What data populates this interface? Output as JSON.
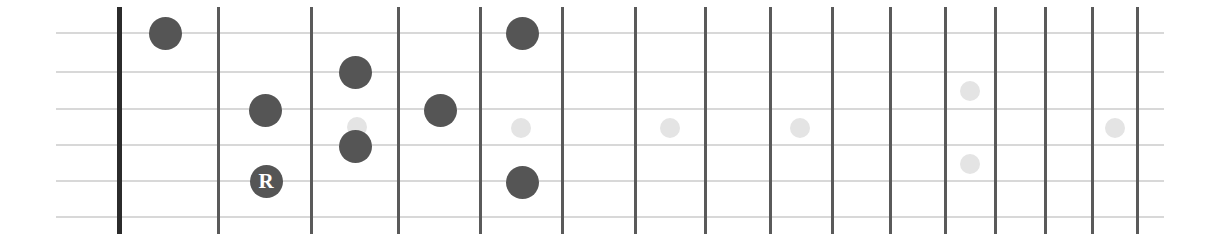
{
  "diagram": {
    "type": "guitar-fretboard",
    "background_color": "#ffffff",
    "note_color": "#555555",
    "inlay_color": "#e4e4e4",
    "string_color": "#d8d8d8",
    "fret_color": "#5a5a5a",
    "nut_color": "#2b2b2b",
    "string_count": 6,
    "fret_count": 15,
    "board": {
      "left": 56,
      "right": 1164,
      "top": 33,
      "bottom": 217
    },
    "strings": [
      {
        "index": 1,
        "y": 33
      },
      {
        "index": 2,
        "y": 72
      },
      {
        "index": 3,
        "y": 109
      },
      {
        "index": 4,
        "y": 145
      },
      {
        "index": 5,
        "y": 181
      },
      {
        "index": 6,
        "y": 217
      }
    ],
    "frets": [
      {
        "index": 0,
        "x": 119,
        "is_nut": true
      },
      {
        "index": 1,
        "x": 218,
        "is_nut": false
      },
      {
        "index": 2,
        "x": 311,
        "is_nut": false
      },
      {
        "index": 3,
        "x": 398,
        "is_nut": false
      },
      {
        "index": 4,
        "x": 480,
        "is_nut": false
      },
      {
        "index": 5,
        "x": 562,
        "is_nut": false
      },
      {
        "index": 6,
        "x": 635,
        "is_nut": false
      },
      {
        "index": 7,
        "x": 705,
        "is_nut": false
      },
      {
        "index": 8,
        "x": 770,
        "is_nut": false
      },
      {
        "index": 9,
        "x": 832,
        "is_nut": false
      },
      {
        "index": 10,
        "x": 890,
        "is_nut": false
      },
      {
        "index": 11,
        "x": 945,
        "is_nut": false
      },
      {
        "index": 12,
        "x": 995,
        "is_nut": false
      },
      {
        "index": 13,
        "x": 1045,
        "is_nut": false
      },
      {
        "index": 14,
        "x": 1092,
        "is_nut": false
      },
      {
        "index": 15,
        "x": 1137,
        "is_nut": false
      }
    ],
    "inlays": [
      {
        "name": "inlay-fret-3",
        "x": 357,
        "y": 127,
        "d": 20
      },
      {
        "name": "inlay-fret-5",
        "x": 521,
        "y": 128,
        "d": 20
      },
      {
        "name": "inlay-fret-7",
        "x": 670,
        "y": 128,
        "d": 20
      },
      {
        "name": "inlay-fret-9",
        "x": 800,
        "y": 128,
        "d": 20
      },
      {
        "name": "inlay-fret-12-upper",
        "x": 970,
        "y": 91,
        "d": 20
      },
      {
        "name": "inlay-fret-12-lower",
        "x": 970,
        "y": 164,
        "d": 20
      },
      {
        "name": "inlay-fret-15",
        "x": 1115,
        "y": 128,
        "d": 20
      }
    ],
    "notes": [
      {
        "name": "note-fret1-string1",
        "fret": 1,
        "string": 1,
        "x": 165,
        "y": 33,
        "d": 33,
        "label": "",
        "is_root": false
      },
      {
        "name": "note-fret2-string3",
        "fret": 2,
        "string": 3,
        "x": 265,
        "y": 110,
        "d": 33,
        "label": "",
        "is_root": false
      },
      {
        "name": "note-fret2-string6-root",
        "fret": 2,
        "string": 6,
        "x": 266,
        "y": 181,
        "d": 33,
        "label": "R",
        "is_root": true
      },
      {
        "name": "note-fret3-string2",
        "fret": 3,
        "string": 2,
        "x": 355,
        "y": 72,
        "d": 33,
        "label": "",
        "is_root": false
      },
      {
        "name": "note-fret3-string4",
        "fret": 3,
        "string": 4,
        "x": 355,
        "y": 146,
        "d": 33,
        "label": "",
        "is_root": false
      },
      {
        "name": "note-fret4-string3",
        "fret": 4,
        "string": 3,
        "x": 440,
        "y": 110,
        "d": 33,
        "label": "",
        "is_root": false
      },
      {
        "name": "note-fret5-string1",
        "fret": 5,
        "string": 1,
        "x": 522,
        "y": 33,
        "d": 33,
        "label": "",
        "is_root": false
      },
      {
        "name": "note-fret5-string6",
        "fret": 5,
        "string": 6,
        "x": 522,
        "y": 182,
        "d": 33,
        "label": "",
        "is_root": false
      }
    ]
  }
}
